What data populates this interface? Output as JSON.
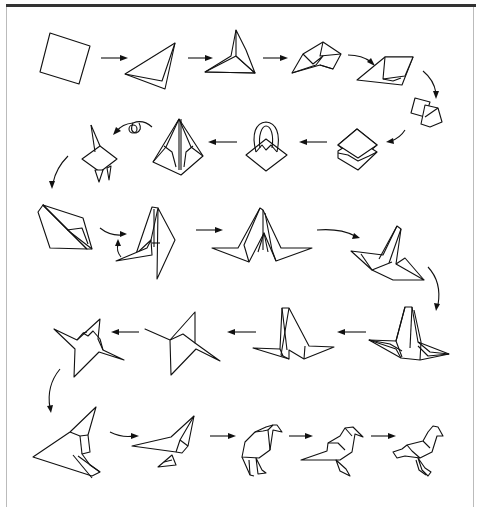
{
  "page": {
    "type": "origami instruction diagram",
    "top_text_cropped": "",
    "frame": {
      "border_color": "#bbbbbb",
      "rule_color": "#333333"
    }
  },
  "diagram": {
    "rows": [
      {
        "row": 1,
        "direction": "left-to-right",
        "steps": [
          "square sheet",
          "triangle fold",
          "squash fold triangle",
          "preliminary fold",
          "square base"
        ]
      },
      {
        "row": 2,
        "direction": "right-to-left",
        "steps": [
          "square base (rotated)",
          "square base open layers",
          "petal fold in progress",
          "bird base",
          "turn over / inside reverse"
        ]
      },
      {
        "row": 3,
        "direction": "left-to-right",
        "steps": [
          "narrowed bird base",
          "reverse fold points",
          "neck and tail spread",
          "wings folded down"
        ]
      },
      {
        "row": 4,
        "direction": "right-to-left",
        "steps": [
          "layered wings",
          "legs formed",
          "body rotated",
          "head shaped"
        ]
      },
      {
        "row": 5,
        "direction": "left-to-right",
        "steps": [
          "outline of bird",
          "tail and legs",
          "bird standing",
          "refined bird",
          "finished bird"
        ]
      }
    ],
    "arrow_count": 19,
    "final_model": "standing bird"
  }
}
